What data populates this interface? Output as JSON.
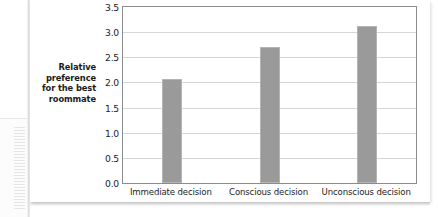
{
  "chart_data": {
    "type": "bar",
    "title": "",
    "subtitle": "",
    "xlabel": "",
    "ylabel": "Relative preference for the best roommate",
    "ylabel_lines": [
      "Relative",
      "preference",
      "for the best",
      "roommate"
    ],
    "categories": [
      "Immediate decision",
      "Conscious decision",
      "Unconscious decision"
    ],
    "values": [
      2.07,
      2.7,
      3.12
    ],
    "ylim": [
      0.0,
      3.5
    ],
    "ytick_labels": [
      "0.0",
      "0.5",
      "1.0",
      "1.5",
      "2.0",
      "2.5",
      "3.0",
      "3.5"
    ],
    "ytick_values": [
      0.0,
      0.5,
      1.0,
      1.5,
      2.0,
      2.5,
      3.0,
      3.5
    ],
    "grid": true,
    "grid_axis": "y",
    "legend": false,
    "legend_position": "none",
    "bar_color": "#9a9a9a",
    "bar_edge_color": "#b4b4b4",
    "gridline_color": "#d6d6d6",
    "frame_color": "#8c8c8c",
    "background_color": "#ffffff",
    "text_color": "#1c1c1c"
  }
}
